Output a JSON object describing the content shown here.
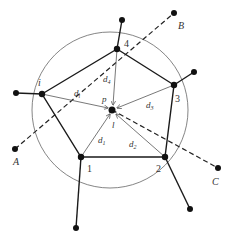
{
  "diagram": {
    "type": "geometric network diagram",
    "colors": {
      "stroke": "#1a1a1a",
      "thin": "#555555",
      "node": "#111111",
      "circle": "#666666"
    },
    "circle": {
      "cx": 110,
      "cy": 110,
      "r": 78
    },
    "center": {
      "x": 112,
      "y": 110,
      "label_p": "p",
      "label_l": "l"
    },
    "vertices": [
      {
        "id": "i",
        "label": "i",
        "x": 42,
        "y": 94,
        "outer": {
          "x": 16,
          "y": 93
        },
        "label_pos": {
          "x": 38,
          "y": 85
        }
      },
      {
        "id": "4",
        "label": "4",
        "x": 117,
        "y": 49,
        "outer": {
          "x": 122,
          "y": 20
        },
        "label_pos": {
          "x": 124,
          "y": 47
        }
      },
      {
        "id": "3",
        "label": "3",
        "x": 174,
        "y": 85,
        "outer": {
          "x": 194,
          "y": 72
        },
        "label_pos": {
          "x": 175,
          "y": 101
        }
      },
      {
        "id": "2",
        "label": "2",
        "x": 165,
        "y": 157,
        "outer": {
          "x": 190,
          "y": 209
        },
        "label_pos": {
          "x": 155,
          "y": 171
        }
      },
      {
        "id": "1",
        "label": "1",
        "x": 81,
        "y": 157,
        "outer": {
          "x": 76,
          "y": 228
        },
        "label_pos": {
          "x": 87,
          "y": 171
        }
      }
    ],
    "distances": [
      {
        "label": "d",
        "sub": "4",
        "x": 104,
        "y": 80
      },
      {
        "label": "d",
        "sub": "i",
        "x": 74,
        "y": 96
      },
      {
        "label": "d",
        "sub": "3",
        "x": 146,
        "y": 108
      },
      {
        "label": "d",
        "sub": "1",
        "x": 98,
        "y": 142
      },
      {
        "label": "d",
        "sub": "2",
        "x": 129,
        "y": 146
      }
    ],
    "dashed_lines": [
      {
        "from": "A",
        "to": "B"
      },
      {
        "from": "center",
        "to": "C"
      }
    ],
    "external_points": [
      {
        "label": "A",
        "x": 15,
        "y": 149,
        "label_pos": {
          "x": 13,
          "y": 164
        }
      },
      {
        "label": "B",
        "x": 174,
        "y": 13,
        "label_pos": {
          "x": 178,
          "y": 29
        }
      },
      {
        "label": "C",
        "x": 218,
        "y": 168,
        "label_pos": {
          "x": 212,
          "y": 184
        }
      }
    ]
  }
}
